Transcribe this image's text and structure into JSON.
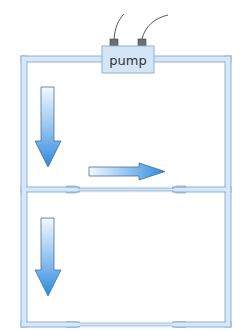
{
  "diagram": {
    "type": "circulation-loop",
    "pump": {
      "label": "pump"
    },
    "colors": {
      "tube_fill": "#d6e8f7",
      "tube_edge": "#8fb1d3",
      "pump_fill": "#d4e6f6",
      "pump_edge": "#8fb1d3",
      "connector": "#6b6b6b",
      "wire": "#555555",
      "arrow_light": "#eef6fd",
      "arrow_dark": "#2f8ee0",
      "arrow_edge": "#4a6f96"
    },
    "loops": [
      {
        "name": "upper-loop",
        "flow_arrows": [
          "down",
          "right"
        ],
        "constrictions": 2
      },
      {
        "name": "lower-loop",
        "flow_arrows": [
          "down"
        ],
        "constrictions": 2
      }
    ]
  }
}
